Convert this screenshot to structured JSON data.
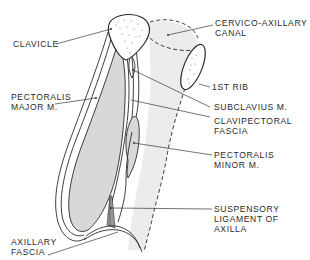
{
  "figure": {
    "type": "anatomical-diagram",
    "colors": {
      "line": "#2a2a2a",
      "muscle_fill": "#d8d8d8",
      "canal_fill": "#ececec",
      "background": "#ffffff"
    }
  },
  "labels": {
    "clavicle": "CLAVICLE",
    "cervico_axillary_canal_1": "CERVICO-AXILLARY",
    "cervico_axillary_canal_2": "CANAL",
    "first_rib": "1ST RIB",
    "pectoralis_major_1": "PECTORALIS",
    "pectoralis_major_2": "MAJOR M.",
    "subclavius": "SUBCLAVIUS M.",
    "clavipectoral_fascia_1": "CLAVIPECTORAL",
    "clavipectoral_fascia_2": "FASCIA",
    "pectoralis_minor_1": "PECTORALIS",
    "pectoralis_minor_2": "MINOR M.",
    "suspensory_ligament_1": "SUSPENSORY",
    "suspensory_ligament_2": "LIGAMENT OF",
    "suspensory_ligament_3": "AXILLA",
    "axillary_fascia_1": "AXILLARY",
    "axillary_fascia_2": "FASCIA"
  }
}
